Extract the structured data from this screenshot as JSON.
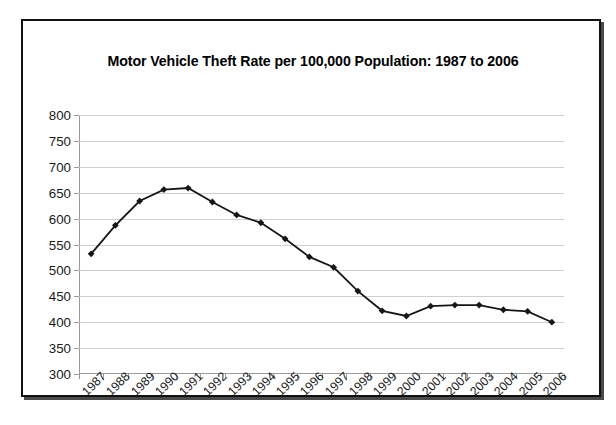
{
  "chart_data": {
    "type": "line",
    "title": "Motor Vehicle Theft Rate per 100,000 Population: 1987 to 2006",
    "xlabel": "",
    "ylabel": "",
    "categories": [
      "1987",
      "1988",
      "1989",
      "1990",
      "1991",
      "1992",
      "1993",
      "1994",
      "1995",
      "1996",
      "1997",
      "1998",
      "1999",
      "2000",
      "2001",
      "2002",
      "2003",
      "2004",
      "2005",
      "2006"
    ],
    "values": [
      532,
      587,
      634,
      656,
      659,
      632,
      607,
      592,
      561,
      526,
      506,
      460,
      422,
      412,
      431,
      433,
      433,
      424,
      421,
      400
    ],
    "ylim": [
      300,
      800
    ],
    "yticks": [
      300,
      350,
      400,
      450,
      500,
      550,
      600,
      650,
      700,
      750,
      800
    ],
    "ytick_labels": [
      "300",
      "350",
      "400",
      "450",
      "500",
      "550",
      "600",
      "650",
      "700",
      "750",
      "800"
    ],
    "grid": true,
    "legend": false,
    "series": [
      {
        "name": "Motor Vehicle Theft Rate",
        "marker": "diamond",
        "line_color": "#161616",
        "marker_color": "#161616",
        "values": [
          532,
          587,
          634,
          656,
          659,
          632,
          607,
          592,
          561,
          526,
          506,
          460,
          422,
          412,
          431,
          433,
          433,
          424,
          421,
          400
        ]
      }
    ]
  },
  "style": {
    "background": "#ffffff",
    "frame_color": "#111111",
    "gridline_color": "#d0d0d0",
    "axis_color": "#9a9a9a",
    "text_color": "#1a1a1a"
  }
}
